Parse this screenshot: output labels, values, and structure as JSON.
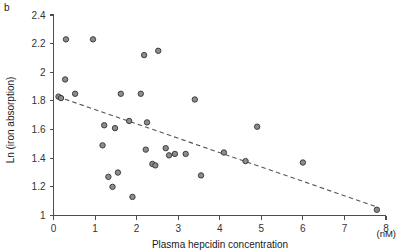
{
  "figure": {
    "panel_label": "b",
    "background_color": "#ffffff",
    "marker_fill": "#8c8c8c",
    "marker_stroke": "#3d3d3d",
    "trend_color": "#555555",
    "axis_color": "#4d4d4d"
  },
  "chart_data": {
    "type": "scatter",
    "title": "",
    "xlabel": "Plasma hepcidin concentration",
    "xunit": "(nM)",
    "ylabel": "Ln (iron absorption)",
    "xlim": [
      0,
      8
    ],
    "ylim": [
      1,
      2.4
    ],
    "xticks": [
      0,
      1,
      2,
      3,
      4,
      5,
      6,
      7,
      8
    ],
    "xticklabels": [
      "0",
      "1",
      "2",
      "3",
      "4",
      "5",
      "6",
      "7",
      "8"
    ],
    "yticks": [
      1,
      1.2,
      1.4,
      1.6,
      1.8,
      2,
      2.2,
      2.4
    ],
    "yticklabels": [
      "1",
      "1.2",
      "1.4",
      "1.6",
      "1.8",
      "2",
      "2.2",
      "2.4"
    ],
    "grid": false,
    "legend": null,
    "series": [
      {
        "name": "subjects",
        "marker": "circle",
        "points": [
          [
            0.12,
            1.83
          ],
          [
            0.18,
            1.82
          ],
          [
            0.28,
            1.95
          ],
          [
            0.3,
            2.23
          ],
          [
            0.52,
            1.85
          ],
          [
            0.95,
            2.23
          ],
          [
            1.18,
            1.49
          ],
          [
            1.22,
            1.63
          ],
          [
            1.32,
            1.27
          ],
          [
            1.42,
            1.2
          ],
          [
            1.48,
            1.61
          ],
          [
            1.55,
            1.3
          ],
          [
            1.62,
            1.85
          ],
          [
            1.82,
            1.66
          ],
          [
            1.9,
            1.13
          ],
          [
            2.1,
            1.85
          ],
          [
            2.18,
            2.12
          ],
          [
            2.22,
            1.46
          ],
          [
            2.25,
            1.65
          ],
          [
            2.38,
            1.36
          ],
          [
            2.45,
            1.35
          ],
          [
            2.52,
            2.15
          ],
          [
            2.7,
            1.47
          ],
          [
            2.78,
            1.42
          ],
          [
            2.92,
            1.43
          ],
          [
            3.18,
            1.43
          ],
          [
            3.4,
            1.81
          ],
          [
            3.55,
            1.28
          ],
          [
            4.1,
            1.44
          ],
          [
            4.62,
            1.38
          ],
          [
            4.9,
            1.62
          ],
          [
            6.0,
            1.37
          ],
          [
            7.78,
            1.04
          ]
        ]
      }
    ],
    "trend": {
      "type": "dashed-linear-fit",
      "x_start": 0.1,
      "y_start": 1.83,
      "x_end": 7.78,
      "y_end": 1.06
    }
  }
}
